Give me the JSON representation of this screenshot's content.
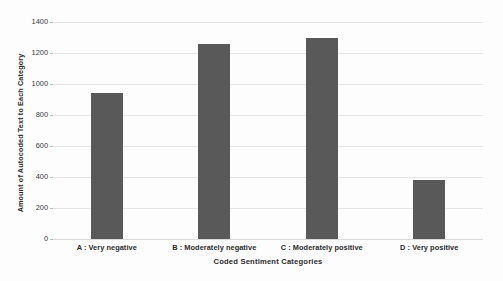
{
  "chart_data": {
    "type": "bar",
    "title": "",
    "subtitle": "",
    "xlabel": "Coded Sentiment Categories",
    "ylabel": "Amount of Autocoded Text to Each Category",
    "categories": [
      "A : Very negative",
      "B : Moderately negative",
      "C : Moderately positive",
      "D : Very positive"
    ],
    "values": [
      945,
      1260,
      1295,
      380
    ],
    "ylim": [
      0,
      1400
    ],
    "ytick_labels": [
      "0",
      "200",
      "400",
      "600",
      "800",
      "1000",
      "1200",
      "1400"
    ],
    "ytick_values": [
      0,
      200,
      400,
      600,
      800,
      1000,
      1200,
      1400
    ],
    "grid": true,
    "legend": false,
    "bar_color": "#595959",
    "gridline_color": "#e6e6e6",
    "background_color": "#fdfdfd",
    "text_color": "#2b2b2b"
  }
}
